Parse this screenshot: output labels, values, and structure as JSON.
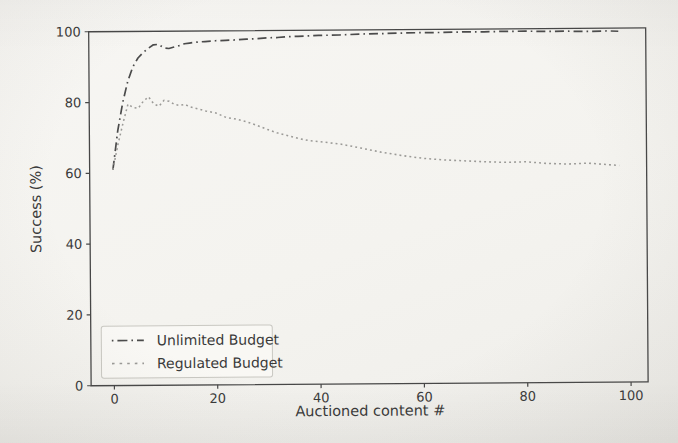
{
  "colors": {
    "background": "#f5f4f1",
    "ink": "#3a3a3a",
    "spine": "#474747",
    "legend_border": "#c9c8c2"
  },
  "chart_data": {
    "type": "line",
    "title": "",
    "xlabel": "Auctioned content #",
    "ylabel": "Success (%)",
    "xlim": [
      -4.5,
      103.3
    ],
    "ylim": [
      0,
      100
    ],
    "xticks": [
      0,
      20,
      40,
      60,
      80,
      100
    ],
    "yticks": [
      0,
      20,
      40,
      60,
      80,
      100
    ],
    "grid": false,
    "legend_position": "lower left",
    "series": [
      {
        "name": "Unlimited Budget",
        "linestyle": "dashdot",
        "color": "#4b4b4b",
        "x": [
          0,
          1,
          2,
          3,
          4,
          5,
          6,
          7,
          8,
          9,
          10,
          11,
          12,
          13,
          14,
          15,
          16,
          18,
          20,
          22,
          24,
          26,
          28,
          30,
          32,
          34,
          36,
          38,
          40,
          44,
          48,
          52,
          56,
          60,
          64,
          68,
          72,
          76,
          80,
          84,
          88,
          92,
          96,
          98
        ],
        "y": [
          61,
          72,
          80,
          86,
          90,
          92.5,
          94,
          95.2,
          96.2,
          96.3,
          95.3,
          95.1,
          95.5,
          95.9,
          96.4,
          96.6,
          96.8,
          97.0,
          97.2,
          97.3,
          97.4,
          97.6,
          97.7,
          97.9,
          98.0,
          98.2,
          98.3,
          98.4,
          98.5,
          98.6,
          98.8,
          98.9,
          99.0,
          99.1,
          99.1,
          99.2,
          99.2,
          99.3,
          99.3,
          99.2,
          99.2,
          99.1,
          99.2,
          99.1
        ]
      },
      {
        "name": "Regulated Budget",
        "linestyle": "dotted",
        "color": "#9b9a97",
        "x": [
          0,
          1,
          2,
          3,
          4,
          5,
          6,
          7,
          8,
          9,
          10,
          11,
          12,
          13,
          14,
          15,
          16,
          18,
          20,
          22,
          24,
          26,
          28,
          30,
          32,
          34,
          36,
          38,
          40,
          44,
          48,
          52,
          56,
          60,
          64,
          68,
          72,
          76,
          80,
          84,
          88,
          92,
          96,
          98
        ],
        "y": [
          61,
          68,
          74,
          79.5,
          78.5,
          78.3,
          80.3,
          81.5,
          79.5,
          78.8,
          80.5,
          80.2,
          79.3,
          79.0,
          79.3,
          78.6,
          78.2,
          77.4,
          76.8,
          75.5,
          75.0,
          74.2,
          73.2,
          72.0,
          71.0,
          70.2,
          69.4,
          68.8,
          68.5,
          67.8,
          66.6,
          65.4,
          64.4,
          63.6,
          63.1,
          62.8,
          62.5,
          62.3,
          62.4,
          61.9,
          61.7,
          61.9,
          61.4,
          61.2
        ]
      }
    ]
  }
}
